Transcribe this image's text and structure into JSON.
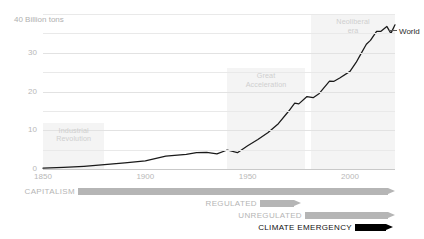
{
  "chart_data": {
    "type": "line",
    "title": "",
    "ylabel": "40 Billion tons",
    "xlabel": "",
    "xlim": [
      1850,
      2022
    ],
    "ylim": [
      0,
      40
    ],
    "grid": true,
    "legend_position": "right-of-line-end",
    "yticks": [
      "0",
      "10",
      "20",
      "30"
    ],
    "ytick_values": [
      0,
      10,
      20,
      30
    ],
    "yminor_values": [
      5,
      15,
      25,
      35,
      40
    ],
    "xticks": [
      "1850",
      "1900",
      "1950",
      "2000"
    ],
    "xtick_values": [
      1850,
      1900,
      1950,
      2000
    ],
    "series": [
      {
        "name": "World",
        "x": [
          1850,
          1860,
          1870,
          1880,
          1890,
          1900,
          1910,
          1920,
          1925,
          1930,
          1935,
          1940,
          1945,
          1950,
          1955,
          1960,
          1965,
          1970,
          1973,
          1975,
          1979,
          1982,
          1985,
          1990,
          1992,
          1995,
          2000,
          2003,
          2005,
          2008,
          2010,
          2013,
          2015,
          2018,
          2020,
          2022
        ],
        "values": [
          0.2,
          0.4,
          0.7,
          1.1,
          1.6,
          2.1,
          3.3,
          3.8,
          4.2,
          4.3,
          3.9,
          4.9,
          4.2,
          6.0,
          7.6,
          9.4,
          11.7,
          14.9,
          17.0,
          16.8,
          18.7,
          18.4,
          19.5,
          22.7,
          22.6,
          23.5,
          25.2,
          27.5,
          29.4,
          32.2,
          33.2,
          35.5,
          35.5,
          36.8,
          35.0,
          37.2
        ]
      }
    ],
    "annotations": [
      {
        "id": "industrial-revolution",
        "label": "Industrial\nRevolution",
        "line1": "Industrial",
        "line2": "Revolution",
        "x_start": 1850,
        "x_end": 1880,
        "y_top": 12
      },
      {
        "id": "great-acceleration",
        "label": "Great\nAcceleration",
        "line1": "Great",
        "line2": "Acceleration",
        "x_start": 1940,
        "x_end": 1978,
        "y_top": 26
      },
      {
        "id": "neoliberal-era",
        "label": "Neoliberal\nera",
        "line1": "Neoliberal",
        "line2": "era",
        "x_start": 1981,
        "x_end": 2022,
        "y_top": 40
      }
    ]
  },
  "timeline": {
    "rows": [
      {
        "id": "capitalism",
        "label": "CAPITALISM",
        "color": "#b5b5b5",
        "label_color": "#b5b5b5",
        "bar_left": 78,
        "bar_right": 395,
        "top": 1
      },
      {
        "id": "regulated",
        "label": "REGULATED",
        "color": "#b5b5b5",
        "label_color": "#b5b5b5",
        "bar_left": 260,
        "bar_right": 301,
        "top": 13
      },
      {
        "id": "unregulated",
        "label": "UNREGULATED",
        "color": "#b5b5b5",
        "label_color": "#b5b5b5",
        "bar_left": 305,
        "bar_right": 395,
        "top": 25
      },
      {
        "id": "climate-emergency",
        "label": "CLIMATE EMERGENCY",
        "color": "#000000",
        "label_color": "#111111",
        "bar_left": 355,
        "bar_right": 393,
        "top": 37
      }
    ]
  },
  "colors": {
    "series_line": "#1a1a1a",
    "grid": "#e9e9e9",
    "band_fill": "#f4f4f4",
    "tick_text": "#b8b8b8",
    "annotation_text": "#cfcfcf"
  }
}
